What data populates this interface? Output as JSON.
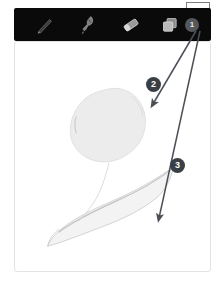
{
  "app": {
    "name": "drawing-app",
    "canvas_background": "#ffffff",
    "toolbar_background": "#0a0a0a"
  },
  "toolbar": {
    "tools": [
      {
        "id": "pen",
        "icon": "pen-icon",
        "label": "Pen",
        "selected": false
      },
      {
        "id": "brush",
        "icon": "brush-icon",
        "label": "Brush",
        "selected": false
      },
      {
        "id": "eraser",
        "icon": "eraser-icon",
        "label": "Eraser",
        "selected": false
      },
      {
        "id": "layers",
        "icon": "layers-icon",
        "label": "Layers",
        "selected": false
      }
    ],
    "layer_count": "1",
    "color_swatch": {
      "label": "Color",
      "color": "#f2f2f2",
      "selected": true
    }
  },
  "canvas": {
    "label": "Drawing canvas",
    "shapes": [
      {
        "id": "upper-blob",
        "name": "leaf-body-shape",
        "fill": "#ececed"
      },
      {
        "id": "lower-leaf",
        "name": "leaf-tail-shape",
        "fill": "#f3f3f4"
      }
    ]
  },
  "annotations": {
    "markers": [
      {
        "id": "2",
        "label": "2",
        "target": "upper-blob",
        "color": "#3a3f45"
      },
      {
        "id": "3",
        "label": "3",
        "target": "lower-leaf",
        "color": "#3a3f45"
      }
    ],
    "arrow_color": "#4b5057",
    "origin": {
      "x": 198,
      "y": 28
    }
  }
}
